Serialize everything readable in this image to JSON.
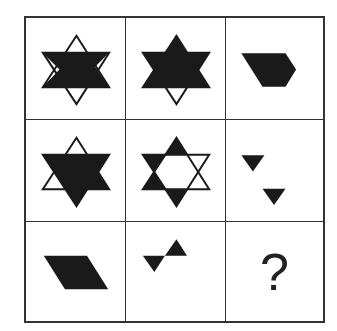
{
  "puzzle": {
    "title": "3x3 figure reasoning matrix",
    "rows": 3,
    "cols": 3,
    "colors": {
      "fill": "#1a1a1a",
      "stroke": "#1a1a1a",
      "background": "#ffffff",
      "grid_line": "#333333"
    },
    "cells": [
      {
        "row": 1,
        "col": 1,
        "description": "hexagram outline with left parallelogram region filled"
      },
      {
        "row": 1,
        "col": 2,
        "description": "hexagram outline with upward triangle filled"
      },
      {
        "row": 1,
        "col": 3,
        "description": "filled pentagon (parallelogram with right point)"
      },
      {
        "row": 2,
        "col": 1,
        "description": "hexagram outline with region filled except top and lower-left tips"
      },
      {
        "row": 2,
        "col": 2,
        "description": "hexagram outline with top, left two and bottom tips filled"
      },
      {
        "row": 2,
        "col": 3,
        "description": "two small filled downward triangles, offset diagonally"
      },
      {
        "row": 3,
        "col": 1,
        "description": "filled parallelogram"
      },
      {
        "row": 3,
        "col": 2,
        "description": "bowtie of two small filled triangles"
      },
      {
        "row": 3,
        "col": 3,
        "description": "question mark",
        "text": "?"
      }
    ],
    "answer_placeholder": "?"
  }
}
